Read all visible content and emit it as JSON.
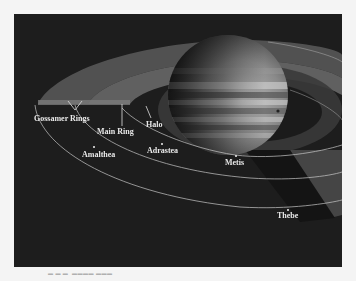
{
  "figure": {
    "background_color": "#1d1d1d",
    "page_color": "#f4f4f4",
    "labels": [
      {
        "id": "gossamer",
        "text": "Gossamer Rings"
      },
      {
        "id": "main",
        "text": "Main Ring"
      },
      {
        "id": "halo",
        "text": "Halo"
      },
      {
        "id": "amalthea",
        "text": "Amalthea"
      },
      {
        "id": "adrastea",
        "text": "Adrastea"
      },
      {
        "id": "metis",
        "text": "Metis"
      },
      {
        "id": "thebe",
        "text": "Thebe"
      }
    ],
    "caption": "Figure ... (illegible)"
  }
}
